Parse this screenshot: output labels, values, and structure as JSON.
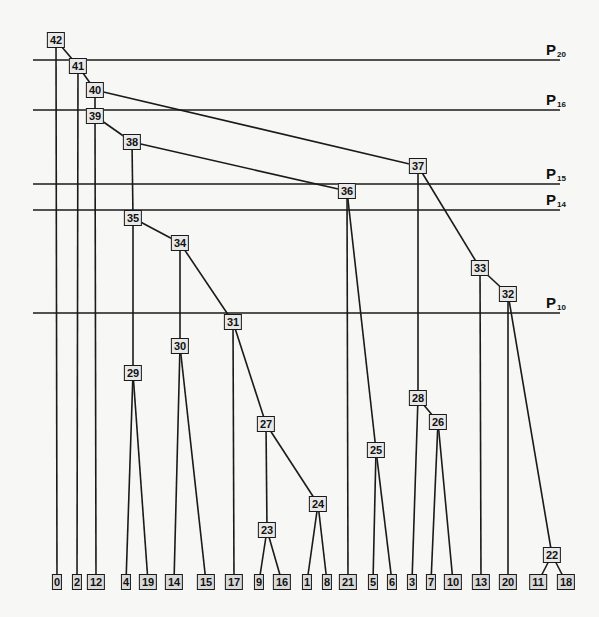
{
  "diagram": {
    "type": "hierarchical-clustering-tree",
    "partition_lines": [
      {
        "label": "P",
        "sub": "20",
        "y": 60
      },
      {
        "label": "P",
        "sub": "16",
        "y": 110
      },
      {
        "label": "P",
        "sub": "15",
        "y": 184
      },
      {
        "label": "P",
        "sub": "14",
        "y": 210
      },
      {
        "label": "P",
        "sub": "10",
        "y": 313
      }
    ],
    "nodes": [
      {
        "id": "42",
        "x": 56,
        "y": 40
      },
      {
        "id": "41",
        "x": 78,
        "y": 66
      },
      {
        "id": "40",
        "x": 95,
        "y": 90
      },
      {
        "id": "39",
        "x": 95,
        "y": 116
      },
      {
        "id": "38",
        "x": 132,
        "y": 142
      },
      {
        "id": "37",
        "x": 418,
        "y": 166
      },
      {
        "id": "36",
        "x": 347,
        "y": 191
      },
      {
        "id": "35",
        "x": 133,
        "y": 218
      },
      {
        "id": "34",
        "x": 180,
        "y": 243
      },
      {
        "id": "33",
        "x": 480,
        "y": 268
      },
      {
        "id": "32",
        "x": 508,
        "y": 294
      },
      {
        "id": "31",
        "x": 233,
        "y": 322
      },
      {
        "id": "30",
        "x": 180,
        "y": 346
      },
      {
        "id": "29",
        "x": 133,
        "y": 373
      },
      {
        "id": "28",
        "x": 418,
        "y": 398
      },
      {
        "id": "27",
        "x": 266,
        "y": 424
      },
      {
        "id": "26",
        "x": 438,
        "y": 422
      },
      {
        "id": "25",
        "x": 376,
        "y": 450
      },
      {
        "id": "24",
        "x": 318,
        "y": 504
      },
      {
        "id": "23",
        "x": 267,
        "y": 530
      },
      {
        "id": "22",
        "x": 552,
        "y": 555
      }
    ],
    "leaves": [
      {
        "id": "0",
        "x": 57
      },
      {
        "id": "2",
        "x": 77
      },
      {
        "id": "12",
        "x": 96
      },
      {
        "id": "4",
        "x": 126
      },
      {
        "id": "19",
        "x": 148
      },
      {
        "id": "14",
        "x": 174
      },
      {
        "id": "15",
        "x": 206
      },
      {
        "id": "17",
        "x": 234
      },
      {
        "id": "9",
        "x": 259
      },
      {
        "id": "16",
        "x": 282
      },
      {
        "id": "1",
        "x": 307
      },
      {
        "id": "8",
        "x": 327
      },
      {
        "id": "21",
        "x": 348
      },
      {
        "id": "5",
        "x": 373
      },
      {
        "id": "6",
        "x": 392
      },
      {
        "id": "3",
        "x": 412
      },
      {
        "id": "7",
        "x": 431
      },
      {
        "id": "10",
        "x": 453
      },
      {
        "id": "13",
        "x": 481
      },
      {
        "id": "20",
        "x": 508
      },
      {
        "id": "11",
        "x": 538
      },
      {
        "id": "18",
        "x": 566
      }
    ],
    "leaf_y": 582,
    "edges": [
      [
        "42",
        "0"
      ],
      [
        "42",
        "41"
      ],
      [
        "41",
        "2"
      ],
      [
        "41",
        "40"
      ],
      [
        "40",
        "39"
      ],
      [
        "40",
        "37"
      ],
      [
        "39",
        "12"
      ],
      [
        "39",
        "38"
      ],
      [
        "38",
        "35"
      ],
      [
        "38",
        "36"
      ],
      [
        "37",
        "28"
      ],
      [
        "37",
        "33"
      ],
      [
        "36",
        "21"
      ],
      [
        "36",
        "25"
      ],
      [
        "35",
        "29"
      ],
      [
        "35",
        "34"
      ],
      [
        "34",
        "30"
      ],
      [
        "34",
        "31"
      ],
      [
        "33",
        "13"
      ],
      [
        "33",
        "32"
      ],
      [
        "32",
        "20"
      ],
      [
        "32",
        "22"
      ],
      [
        "31",
        "17"
      ],
      [
        "31",
        "27"
      ],
      [
        "30",
        "14"
      ],
      [
        "30",
        "15"
      ],
      [
        "29",
        "4"
      ],
      [
        "29",
        "19"
      ],
      [
        "28",
        "3"
      ],
      [
        "28",
        "26"
      ],
      [
        "27",
        "23"
      ],
      [
        "27",
        "24"
      ],
      [
        "26",
        "7"
      ],
      [
        "26",
        "10"
      ],
      [
        "25",
        "5"
      ],
      [
        "25",
        "6"
      ],
      [
        "24",
        "1"
      ],
      [
        "24",
        "8"
      ],
      [
        "23",
        "9"
      ],
      [
        "23",
        "16"
      ],
      [
        "22",
        "11"
      ],
      [
        "22",
        "18"
      ]
    ],
    "line_x_start": 33,
    "line_x_end": 560,
    "colors": {
      "ink": "#1a1a1a",
      "paper": "#f7f7f5",
      "box_fill": "#e8e8e8"
    }
  }
}
